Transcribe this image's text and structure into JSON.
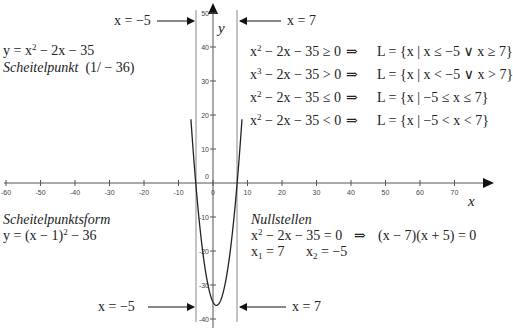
{
  "chart_data": {
    "type": "line",
    "title": "",
    "function": "y = x^2 - 2x - 35",
    "xlabel": "x",
    "ylabel": "y",
    "xlim": [
      -62,
      78
    ],
    "ylim": [
      -41,
      51
    ],
    "x_ticks": [
      -60,
      -50,
      -40,
      -30,
      -20,
      -10,
      0,
      10,
      20,
      30,
      40,
      50,
      60,
      70
    ],
    "y_ticks": [
      50,
      40,
      30,
      20,
      10,
      0,
      -10,
      -20,
      -30,
      -40
    ],
    "series": [
      {
        "name": "y = x^2 - 2x - 35",
        "x": [
          -6,
          -5,
          -4,
          -3,
          -2,
          -1,
          0,
          1,
          2,
          3,
          4,
          5,
          6,
          7,
          8,
          9
        ],
        "y": [
          13,
          0,
          -11,
          -20,
          -27,
          -32,
          -35,
          -36,
          -35,
          -32,
          -27,
          -20,
          -11,
          0,
          13,
          28
        ]
      }
    ],
    "vertical_lines": [
      -5,
      7
    ],
    "vertex": [
      1,
      -36
    ],
    "roots": [
      7,
      -5
    ],
    "grid": false
  },
  "labels": {
    "top_left_arrow": "x = −5",
    "top_right_arrow": "x = 7",
    "bottom_left_arrow": "x = −5",
    "bottom_right_arrow": "x = 7",
    "y_axis": "y",
    "x_axis": "x"
  },
  "equation": {
    "line1_prefix": "y = x",
    "line1_exp": "2",
    "line1_suffix": " − 2x − 35",
    "vertex_label": "Scheitelpunkt",
    "vertex_value": "(1/ − 36)"
  },
  "vertex_form": {
    "title": "Scheitelpunktsform",
    "prefix": "y = (x − 1)",
    "exp": "2",
    "suffix": " − 36"
  },
  "inequalities": [
    {
      "lhs_base": "x",
      "lhs_exp": "2",
      "lhs_rest": " − 2x − 35 ≥ 0",
      "arrow": "⇒",
      "solution": "L = {x | x ≤ −5 ∨ x ≥ 7}"
    },
    {
      "lhs_base": "x",
      "lhs_exp": "3",
      "lhs_rest": " − 2x − 35 > 0",
      "arrow": "⇒",
      "solution": "L = {x | x < −5 ∨ x > 7}"
    },
    {
      "lhs_base": "x",
      "lhs_exp": "2",
      "lhs_rest": " − 2x − 35 ≤ 0",
      "arrow": "⇒",
      "solution": "L = {x | −5 ≤ x ≤ 7}"
    },
    {
      "lhs_base": "x",
      "lhs_exp": "2",
      "lhs_rest": " − 2x − 35 < 0",
      "arrow": "⇒",
      "solution": "L = {x | −5 < x < 7}"
    }
  ],
  "roots_section": {
    "title": "Nullstellen",
    "eq_base": "x",
    "eq_exp": "2",
    "eq_rest": " − 2x − 35 = 0",
    "arrow": "⇒",
    "factored": "(x − 7)(x + 5) = 0",
    "x1_label": "x",
    "x1_sub": "1",
    "x1_value": " = 7",
    "x2_label": "x",
    "x2_sub": "2",
    "x2_value": " = −5"
  }
}
